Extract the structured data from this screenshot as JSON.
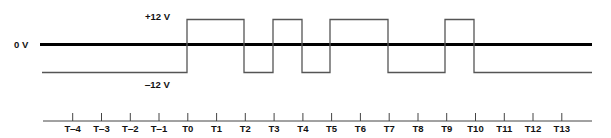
{
  "diagram": {
    "title": "",
    "labels": {
      "high": "+12 V",
      "zero": "0 V",
      "low": "‒12 V"
    },
    "levels_px": {
      "high": 19.5,
      "zero": 44.5,
      "low": 72.5
    },
    "colors": {
      "zero_line": "#000000",
      "signal": "#555555",
      "axis": "#444444",
      "text": "#111111"
    },
    "line_extent_px": {
      "x_start": 40,
      "x_end": 592
    },
    "time_axis": {
      "y_px": 121,
      "x_start": 43,
      "x_end": 592,
      "tick_top_px": 113,
      "label_y_px": 132,
      "ticks": [
        {
          "label": "T‒4",
          "x": 72.7
        },
        {
          "label": "T‒3",
          "x": 101.5
        },
        {
          "label": "T‒2",
          "x": 130.3
        },
        {
          "label": "T‒1",
          "x": 159.0
        },
        {
          "label": "T0",
          "x": 187.8
        },
        {
          "label": "T1",
          "x": 216.6
        },
        {
          "label": "T2",
          "x": 245.3
        },
        {
          "label": "T3",
          "x": 274.1
        },
        {
          "label": "T4",
          "x": 302.9
        },
        {
          "label": "T5",
          "x": 331.6
        },
        {
          "label": "T6",
          "x": 360.4
        },
        {
          "label": "T7",
          "x": 389.2
        },
        {
          "label": "T8",
          "x": 418.0
        },
        {
          "label": "T9",
          "x": 446.7
        },
        {
          "label": "T10",
          "x": 475.5
        },
        {
          "label": "T11",
          "x": 504.3
        },
        {
          "label": "T12",
          "x": 533.0
        },
        {
          "label": "T13",
          "x": 561.8
        }
      ]
    },
    "signal": {
      "description": "RS-232 style waveform: -12 V idle, +12 V pulses",
      "x_start": 42,
      "x_end": 592,
      "initial_level": "low",
      "transitions": [
        {
          "at": "T0",
          "x": 187,
          "to": "high"
        },
        {
          "at": "T2",
          "x": 244,
          "to": "low"
        },
        {
          "at": "T3",
          "x": 273,
          "to": "high"
        },
        {
          "at": "T4",
          "x": 302,
          "to": "low"
        },
        {
          "at": "T5",
          "x": 330,
          "to": "high"
        },
        {
          "at": "T7",
          "x": 388,
          "to": "low"
        },
        {
          "at": "T9",
          "x": 445,
          "to": "high"
        },
        {
          "at": "T10",
          "x": 474,
          "to": "low"
        }
      ]
    }
  }
}
